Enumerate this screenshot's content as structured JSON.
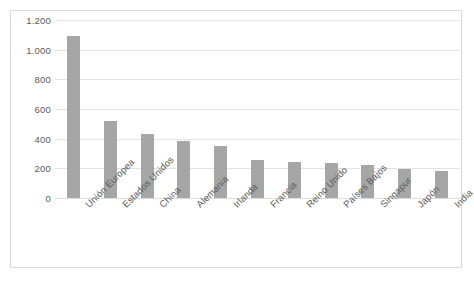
{
  "chart_data": {
    "type": "bar",
    "title": "",
    "xlabel": "",
    "ylabel": "",
    "ylim": [
      0,
      1200
    ],
    "ytick_labels": [
      "1.200",
      "1.000",
      "800",
      "600",
      "400",
      "200",
      "0"
    ],
    "yticks": [
      1200,
      1000,
      800,
      600,
      400,
      200,
      0
    ],
    "grid": true,
    "legend": "none",
    "bar_color": "#a6a6a6",
    "gridline_color": "#e2e2e2",
    "border_color": "#d9d9d9",
    "text_color": "#5a5a5a",
    "categories": [
      "Unión Europea",
      "Estados Unidos",
      "China",
      "Alemania",
      "Irlanda",
      "Francia",
      "Reino Unido",
      "Países Bajos",
      "Singapur",
      "Japón",
      "India"
    ],
    "values": [
      1090,
      520,
      430,
      385,
      348,
      255,
      243,
      235,
      222,
      193,
      180
    ]
  }
}
